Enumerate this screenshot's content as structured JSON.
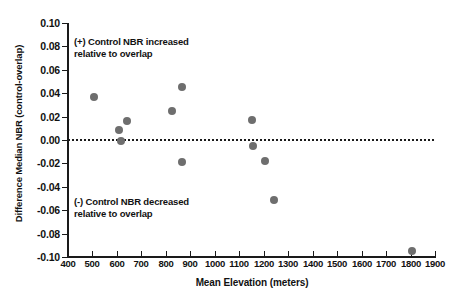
{
  "chart_data": {
    "type": "scatter",
    "title": "",
    "xlabel": "Mean Elevation (meters)",
    "ylabel": "Difference Median NBR (control-overlap)",
    "xlim": [
      400,
      1900
    ],
    "ylim": [
      -0.1,
      0.1
    ],
    "grid": false,
    "legend": "none",
    "marker_color": "#6e6e6e",
    "reference_line": {
      "axis": "y",
      "value": 0.0,
      "style": "dotted",
      "color": "#1a1a1a"
    },
    "xticks": [
      400,
      500,
      600,
      700,
      800,
      900,
      1000,
      1100,
      1200,
      1300,
      1400,
      1500,
      1600,
      1700,
      1800,
      1900
    ],
    "xticklabels": [
      "400",
      "500",
      "600",
      "700",
      "800",
      "900",
      "1000",
      "1100",
      "1200",
      "1300",
      "1400",
      "1500",
      "1600",
      "1700",
      "1800",
      "1900"
    ],
    "yticks": [
      0.1,
      0.08,
      0.06,
      0.04,
      0.02,
      0.0,
      -0.02,
      -0.04,
      -0.06,
      -0.08,
      -0.1
    ],
    "yticklabels": [
      "0.10",
      "0.08",
      "0.06",
      "0.04",
      "0.02",
      "0.00",
      "-0.02",
      "-0.04",
      "-0.06",
      "-0.08",
      "-0.10"
    ],
    "points": [
      {
        "x": 505,
        "y": 0.037
      },
      {
        "x": 610,
        "y": 0.009
      },
      {
        "x": 615,
        "y": -0.001
      },
      {
        "x": 640,
        "y": 0.016
      },
      {
        "x": 825,
        "y": 0.025
      },
      {
        "x": 866,
        "y": 0.045
      },
      {
        "x": 864,
        "y": -0.019
      },
      {
        "x": 1152,
        "y": 0.017
      },
      {
        "x": 1155,
        "y": -0.005
      },
      {
        "x": 1203,
        "y": -0.018
      },
      {
        "x": 1243,
        "y": -0.051
      },
      {
        "x": 1805,
        "y": -0.095
      }
    ],
    "annotations": [
      {
        "name": "positive-note",
        "text": "(+) Control NBR increased\nrelative to overlap",
        "x": 460,
        "y": 0.082
      },
      {
        "name": "negative-note",
        "text": "(-) Control NBR decreased\nrelative to overlap",
        "x": 460,
        "y": -0.055
      }
    ]
  }
}
